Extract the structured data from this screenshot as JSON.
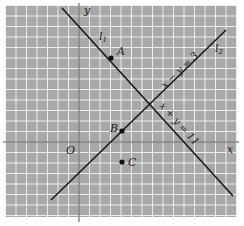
{
  "figure": {
    "background": "#ffffff",
    "grid": {
      "x0": 5,
      "y0": 5,
      "x1": 237,
      "y1": 217,
      "spacing": 10.5,
      "fill": "#a8a8a8",
      "line_color": "#eeeeee"
    },
    "axes": {
      "color": "#555555",
      "y_axis_x": 79,
      "x_axis_y": 142,
      "x_label": "x",
      "y_label": "y",
      "origin_label": "O"
    },
    "lines": [
      {
        "id": "l1",
        "label": "l1",
        "label_main": "l",
        "label_sub": "1",
        "equation": "x + y = 11",
        "x1": 62,
        "y1": 8,
        "x2": 233,
        "y2": 196
      },
      {
        "id": "l2",
        "label": "l2",
        "label_main": "l",
        "label_sub": "2",
        "equation": "x − y = 3",
        "x1": 51,
        "y1": 200,
        "x2": 226,
        "y2": 30
      }
    ],
    "points": [
      {
        "label": "A",
        "x": 111,
        "y": 58
      },
      {
        "label": "B",
        "x": 122,
        "y": 131
      },
      {
        "label": "C",
        "x": 122,
        "y": 162
      }
    ],
    "labels": {
      "l1_label": "l",
      "l1_sub": "1",
      "l2_label": "l",
      "l2_sub": "2",
      "eq1": "x − y = 3",
      "eq2": "x + y = 11",
      "A": "A",
      "B": "B",
      "C": "C"
    }
  }
}
